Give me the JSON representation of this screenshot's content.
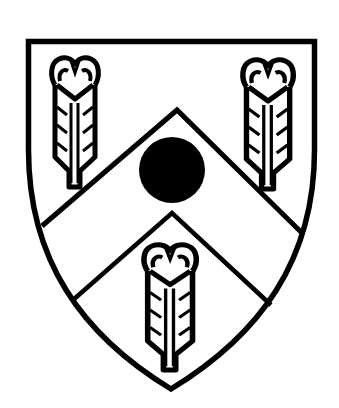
{
  "image": {
    "description": "Heraldic shield (escutcheon) in black line art: a chevron between three feathers, with a roundel on the chevron",
    "background_color": "#ffffff",
    "ink_color": "#000000"
  },
  "shield": {
    "shape": "heater shield",
    "field": "white",
    "outline": "thick black"
  },
  "charges": [
    {
      "name": "feather",
      "position": "upper-left"
    },
    {
      "name": "feather",
      "position": "upper-right"
    },
    {
      "name": "chevron",
      "position": "center"
    },
    {
      "name": "roundel",
      "position": "on chevron apex",
      "fill": "black"
    },
    {
      "name": "feather",
      "position": "lower-center"
    }
  ]
}
